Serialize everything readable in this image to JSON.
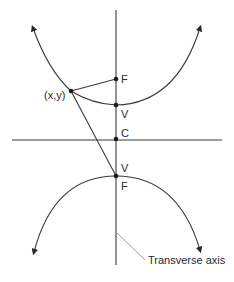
{
  "diagram": {
    "type": "hyperbola-construction",
    "labels": {
      "point": "(x,y)",
      "focus_upper": "F",
      "vertex_upper": "V",
      "center": "C",
      "vertex_lower": "V",
      "focus_lower": "F",
      "transverse_axis": "Transverse axis"
    },
    "colors": {
      "stroke": "#3a3a3a",
      "leader": "#9a9a9a",
      "point": "#1a1a1a",
      "background": "#ffffff"
    }
  }
}
